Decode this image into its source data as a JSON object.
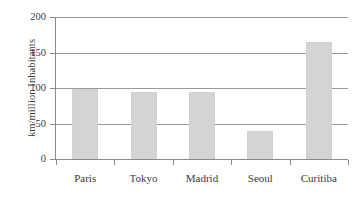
{
  "chart_data": {
    "type": "bar",
    "title": "",
    "subtitle": "",
    "xlabel": "",
    "ylabel": "km/million Inhabitants",
    "categories": [
      "Paris",
      "Tokyo",
      "Madrid",
      "Seoul",
      "Curitiba"
    ],
    "values": [
      98,
      95,
      94,
      39,
      165
    ],
    "series": [
      {
        "name": "km/million Inhabitants",
        "values": [
          98,
          95,
          94,
          39,
          165
        ]
      }
    ],
    "ylim": [
      0,
      200
    ],
    "ytick_labels": [
      "0",
      "50",
      "100",
      "150",
      "200"
    ],
    "ytick_values": [
      0,
      50,
      100,
      150,
      200
    ],
    "grid": "horizontal",
    "legend": "none",
    "bar_color": "#d4d4d4",
    "grid_color": "#9a9a9a",
    "axis_color": "#8a8a8a",
    "text_color": "#3b3b3b",
    "annotations": []
  }
}
